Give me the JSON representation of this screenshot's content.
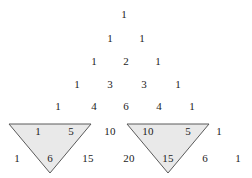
{
  "figure": {
    "name": "pascals-triangle-with-two-shaded-inverted-triangles",
    "width": 252,
    "height": 178,
    "background_color": "#ffffff",
    "text_color": "#1c1c1c"
  },
  "chart_data": {
    "type": "table",
    "title": "",
    "subtitle": "",
    "xlabel": "",
    "ylabel": "",
    "rows": [
      {
        "row_index": 0,
        "values": [
          1
        ]
      },
      {
        "row_index": 1,
        "values": [
          1,
          1
        ]
      },
      {
        "row_index": 2,
        "values": [
          1,
          2,
          1
        ]
      },
      {
        "row_index": 3,
        "values": [
          1,
          3,
          3,
          1
        ]
      },
      {
        "row_index": 4,
        "values": [
          1,
          4,
          6,
          4,
          1
        ]
      },
      {
        "row_index": 5,
        "values": [
          1,
          5,
          10,
          10,
          5,
          1
        ]
      },
      {
        "row_index": 6,
        "values": [
          1,
          6,
          15,
          20,
          15,
          6,
          1
        ]
      }
    ],
    "highlighted_triangles": [
      {
        "label": "left-shaded-triangle",
        "entries": [
          1,
          5,
          6
        ],
        "fill": "#e9e9e9",
        "stroke": "#5a5a5a"
      },
      {
        "label": "right-shaded-triangle",
        "entries": [
          10,
          5,
          15
        ],
        "fill": "#e9e9e9",
        "stroke": "#5a5a5a"
      }
    ]
  },
  "cells": [
    {
      "text": "1",
      "x": 124,
      "y": 14,
      "row": 0,
      "col": 0,
      "shaded": false
    },
    {
      "text": "1",
      "x": 110,
      "y": 38,
      "row": 1,
      "col": 0,
      "shaded": false
    },
    {
      "text": "1",
      "x": 142,
      "y": 38,
      "row": 1,
      "col": 1,
      "shaded": false
    },
    {
      "text": "1",
      "x": 94,
      "y": 61,
      "row": 2,
      "col": 0,
      "shaded": false
    },
    {
      "text": "2",
      "x": 126,
      "y": 61,
      "row": 2,
      "col": 1,
      "shaded": false
    },
    {
      "text": "1",
      "x": 158,
      "y": 61,
      "row": 2,
      "col": 2,
      "shaded": false
    },
    {
      "text": "1",
      "x": 77,
      "y": 84,
      "row": 3,
      "col": 0,
      "shaded": false
    },
    {
      "text": "3",
      "x": 110,
      "y": 84,
      "row": 3,
      "col": 1,
      "shaded": false
    },
    {
      "text": "3",
      "x": 144,
      "y": 84,
      "row": 3,
      "col": 2,
      "shaded": false
    },
    {
      "text": "1",
      "x": 178,
      "y": 84,
      "row": 3,
      "col": 3,
      "shaded": false
    },
    {
      "text": "1",
      "x": 58,
      "y": 106,
      "row": 4,
      "col": 0,
      "shaded": false
    },
    {
      "text": "4",
      "x": 94,
      "y": 106,
      "row": 4,
      "col": 1,
      "shaded": false
    },
    {
      "text": "6",
      "x": 126,
      "y": 106,
      "row": 4,
      "col": 2,
      "shaded": false
    },
    {
      "text": "4",
      "x": 159,
      "y": 106,
      "row": 4,
      "col": 3,
      "shaded": false
    },
    {
      "text": "1",
      "x": 192,
      "y": 106,
      "row": 4,
      "col": 4,
      "shaded": false
    },
    {
      "text": "1",
      "x": 38,
      "y": 131,
      "row": 5,
      "col": 0,
      "shaded": true
    },
    {
      "text": "5",
      "x": 71,
      "y": 131,
      "row": 5,
      "col": 1,
      "shaded": true
    },
    {
      "text": "10",
      "x": 110,
      "y": 131,
      "row": 5,
      "col": 2,
      "shaded": false
    },
    {
      "text": "10",
      "x": 148,
      "y": 131,
      "row": 5,
      "col": 3,
      "shaded": true
    },
    {
      "text": "5",
      "x": 188,
      "y": 131,
      "row": 5,
      "col": 4,
      "shaded": true
    },
    {
      "text": "1",
      "x": 219,
      "y": 131,
      "row": 5,
      "col": 5,
      "shaded": false
    },
    {
      "text": "1",
      "x": 17,
      "y": 158,
      "row": 6,
      "col": 0,
      "shaded": false
    },
    {
      "text": "6",
      "x": 50,
      "y": 158,
      "row": 6,
      "col": 1,
      "shaded": true
    },
    {
      "text": "15",
      "x": 88,
      "y": 158,
      "row": 6,
      "col": 2,
      "shaded": false
    },
    {
      "text": "20",
      "x": 129,
      "y": 158,
      "row": 6,
      "col": 3,
      "shaded": false
    },
    {
      "text": "15",
      "x": 168,
      "y": 158,
      "row": 6,
      "col": 4,
      "shaded": true
    },
    {
      "text": "6",
      "x": 205,
      "y": 158,
      "row": 6,
      "col": 5,
      "shaded": false
    },
    {
      "text": "1",
      "x": 238,
      "y": 158,
      "row": 6,
      "col": 6,
      "shaded": false
    }
  ],
  "triangles": [
    {
      "name": "left-shaded-triangle",
      "points": "9,124 91,124 50,173",
      "fill": "#e9e9e9",
      "stroke": "#5a5a5a"
    },
    {
      "name": "right-shaded-triangle",
      "points": "127,124 209,124 168,173",
      "fill": "#e9e9e9",
      "stroke": "#5a5a5a"
    }
  ]
}
